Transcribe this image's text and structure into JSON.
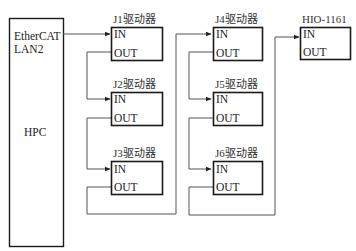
{
  "diagram": {
    "controller": {
      "name": "HPC",
      "port_label_line1": "EtherCAT",
      "port_label_line2": "LAN2"
    },
    "nodes": [
      {
        "id": "J1",
        "label": "J1驱动器",
        "in": "IN",
        "out": "OUT"
      },
      {
        "id": "J2",
        "label": "J2驱动器",
        "in": "IN",
        "out": "OUT"
      },
      {
        "id": "J3",
        "label": "J3驱动器",
        "in": "IN",
        "out": "OUT"
      },
      {
        "id": "J4",
        "label": "J4驱动器",
        "in": "IN",
        "out": "OUT"
      },
      {
        "id": "J5",
        "label": "J5驱动器",
        "in": "IN",
        "out": "OUT"
      },
      {
        "id": "J6",
        "label": "J6驱动器",
        "in": "IN",
        "out": "OUT"
      },
      {
        "id": "HIO",
        "label": "HIO-1161",
        "in": "IN",
        "out": "OUT"
      }
    ],
    "connections": [
      [
        "HPC.EtherCAT",
        "J1.IN"
      ],
      [
        "J1.OUT",
        "J2.IN"
      ],
      [
        "J2.OUT",
        "J3.IN"
      ],
      [
        "J3.OUT",
        "J4.IN"
      ],
      [
        "J4.OUT",
        "J5.IN"
      ],
      [
        "J5.OUT",
        "J6.IN"
      ],
      [
        "J6.OUT",
        "HIO.IN"
      ]
    ]
  }
}
